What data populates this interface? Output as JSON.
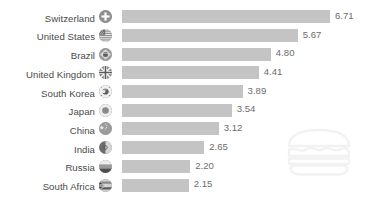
{
  "chart_data": {
    "type": "bar",
    "orientation": "horizontal",
    "title": "",
    "subtitle": "",
    "xlabel": "",
    "ylabel": "",
    "xlim": [
      0,
      7.2
    ],
    "grid": false,
    "legend": null,
    "bar_color": "#c4c4c4",
    "label_color": "#4a4a4a",
    "value_color": "#6d6d6d",
    "background": "#ffffff",
    "categories": [
      "Switzerland",
      "United States",
      "Brazil",
      "United Kingdom",
      "South Korea",
      "Japan",
      "China",
      "India",
      "Russia",
      "South Africa"
    ],
    "values": [
      6.71,
      5.67,
      4.8,
      4.41,
      3.89,
      3.54,
      3.12,
      2.65,
      2.2,
      2.15
    ],
    "value_labels": [
      "6.71",
      "5.67",
      "4.80",
      "4.41",
      "3.89",
      "3.54",
      "3.12",
      "2.65",
      "2.20",
      "2.15"
    ],
    "rows": [
      {
        "label": "Switzerland",
        "value": 6.71,
        "value_label": "6.71",
        "flag": "flag-switzerland-icon"
      },
      {
        "label": "United States",
        "value": 5.67,
        "value_label": "5.67",
        "flag": "flag-united-states-icon"
      },
      {
        "label": "Brazil",
        "value": 4.8,
        "value_label": "4.80",
        "flag": "flag-brazil-icon"
      },
      {
        "label": "United Kingdom",
        "value": 4.41,
        "value_label": "4.41",
        "flag": "flag-united-kingdom-icon"
      },
      {
        "label": "South Korea",
        "value": 3.89,
        "value_label": "3.89",
        "flag": "flag-south-korea-icon"
      },
      {
        "label": "Japan",
        "value": 3.54,
        "value_label": "3.54",
        "flag": "flag-japan-icon"
      },
      {
        "label": "China",
        "value": 3.12,
        "value_label": "3.12",
        "flag": "flag-china-icon"
      },
      {
        "label": "India",
        "value": 2.65,
        "value_label": "2.65",
        "flag": "flag-india-icon"
      },
      {
        "label": "Russia",
        "value": 2.2,
        "value_label": "2.20",
        "flag": "flag-russia-icon"
      },
      {
        "label": "South Africa",
        "value": 2.15,
        "value_label": "2.15",
        "flag": "flag-south-africa-icon"
      }
    ]
  },
  "watermark": {
    "icon": "burger-icon"
  },
  "footnote": {
    "text": ""
  }
}
